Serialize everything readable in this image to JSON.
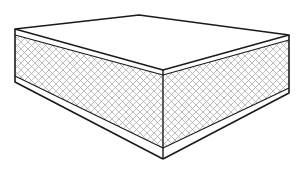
{
  "figure": {
    "colors": {
      "background": "#ffffff",
      "outline": "#1a1a1a",
      "hatch": "#9a9a9a"
    }
  }
}
